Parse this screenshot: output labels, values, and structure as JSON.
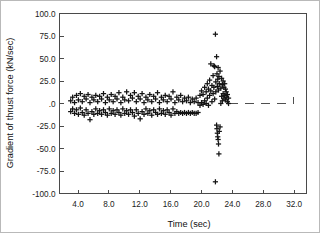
{
  "figure": {
    "background_color": "#ffffff",
    "border_color": "#b9b9b9",
    "marker_color": "#141414",
    "axis_color": "#4a4a4a"
  },
  "chart_data": {
    "type": "scatter",
    "title": "",
    "subtitle": "",
    "xlabel": "Time (sec)",
    "ylabel": "Gradient of thrust force (kN/sec)",
    "xlim": [
      1.6,
      33.6
    ],
    "ylim": [
      -100.0,
      100.0
    ],
    "grid": false,
    "legend": null,
    "legend_position": "none",
    "marker": "plus",
    "xticks": [
      4.0,
      8.0,
      12.0,
      16.0,
      20.0,
      24.0,
      28.0,
      32.0
    ],
    "xtick_labels": [
      "4.0",
      "8.0",
      "12.0",
      "16.0",
      "20.0",
      "24.0",
      "28.0",
      "32.0"
    ],
    "yticks": [
      100.0,
      75.0,
      50.0,
      25.0,
      0.0,
      -25.0,
      -50.0,
      -75.0,
      -100.0
    ],
    "ytick_labels": [
      "100.0",
      "75.0",
      "50.0",
      "25.0",
      ".0",
      "-25.0",
      "-50.0",
      "-75.0",
      "-100.0"
    ],
    "annotations": [
      {
        "name": "zero-reference-dashed-line",
        "type": "dashed-line",
        "y": 0.0,
        "x_start": 23.6,
        "x_end": 31.9,
        "end_tick_height": 7.0
      }
    ],
    "series": [
      {
        "name": "Gradient of thrust force",
        "marker": "plus",
        "color": "#141414",
        "points": [
          [
            3.05,
            3.0
          ],
          [
            3.05,
            -9.0
          ],
          [
            3.3,
            7.0
          ],
          [
            3.3,
            -6.0
          ],
          [
            3.55,
            1.0
          ],
          [
            3.55,
            -11.0
          ],
          [
            3.8,
            9.0
          ],
          [
            3.8,
            -7.0
          ],
          [
            4.05,
            4.0
          ],
          [
            4.05,
            -12.0
          ],
          [
            4.3,
            11.0
          ],
          [
            4.3,
            -5.0
          ],
          [
            4.55,
            2.0
          ],
          [
            4.55,
            -10.0
          ],
          [
            4.8,
            8.0
          ],
          [
            4.8,
            -13.0
          ],
          [
            5.05,
            5.0
          ],
          [
            5.05,
            -7.0
          ],
          [
            5.3,
            10.0
          ],
          [
            5.3,
            -11.0
          ],
          [
            5.55,
            1.0
          ],
          [
            5.55,
            -18.0
          ],
          [
            5.8,
            7.0
          ],
          [
            5.8,
            -9.0
          ],
          [
            6.05,
            4.0
          ],
          [
            6.05,
            -12.0
          ],
          [
            6.3,
            9.0
          ],
          [
            6.3,
            -6.0
          ],
          [
            6.55,
            2.0
          ],
          [
            6.55,
            -11.0
          ],
          [
            6.8,
            8.0
          ],
          [
            6.8,
            -8.0
          ],
          [
            7.05,
            5.0
          ],
          [
            7.05,
            -12.0
          ],
          [
            7.3,
            11.0
          ],
          [
            7.3,
            -7.0
          ],
          [
            7.55,
            1.0
          ],
          [
            7.55,
            -10.0
          ],
          [
            7.8,
            7.0
          ],
          [
            7.8,
            -13.0
          ],
          [
            8.05,
            4.0
          ],
          [
            8.05,
            -6.0
          ],
          [
            8.3,
            10.0
          ],
          [
            8.3,
            -11.0
          ],
          [
            8.55,
            2.0
          ],
          [
            8.55,
            -8.0
          ],
          [
            8.8,
            8.0
          ],
          [
            8.8,
            -12.0
          ],
          [
            9.05,
            5.0
          ],
          [
            9.05,
            -7.0
          ],
          [
            9.3,
            12.0
          ],
          [
            9.3,
            -10.0
          ],
          [
            9.55,
            1.0
          ],
          [
            9.55,
            -13.0
          ],
          [
            9.8,
            7.0
          ],
          [
            9.8,
            -6.0
          ],
          [
            10.05,
            4.0
          ],
          [
            10.05,
            -11.0
          ],
          [
            10.3,
            13.0
          ],
          [
            10.3,
            -8.0
          ],
          [
            10.55,
            3.0
          ],
          [
            10.55,
            -12.0
          ],
          [
            10.8,
            9.0
          ],
          [
            10.8,
            -7.0
          ],
          [
            11.05,
            6.0
          ],
          [
            11.05,
            -10.0
          ],
          [
            11.3,
            12.0
          ],
          [
            11.3,
            -14.0
          ],
          [
            11.55,
            2.0
          ],
          [
            11.55,
            -7.0
          ],
          [
            11.8,
            8.0
          ],
          [
            11.8,
            -11.0
          ],
          [
            12.05,
            5.0
          ],
          [
            12.05,
            -17.0
          ],
          [
            12.3,
            11.0
          ],
          [
            12.3,
            -9.0
          ],
          [
            12.55,
            1.0
          ],
          [
            12.55,
            -12.0
          ],
          [
            12.8,
            7.0
          ],
          [
            12.8,
            -6.0
          ],
          [
            13.05,
            4.0
          ],
          [
            13.05,
            -11.0
          ],
          [
            13.3,
            10.0
          ],
          [
            13.3,
            -8.0
          ],
          [
            13.55,
            2.0
          ],
          [
            13.55,
            -13.0
          ],
          [
            13.8,
            8.0
          ],
          [
            13.8,
            -7.0
          ],
          [
            14.05,
            5.0
          ],
          [
            14.05,
            -10.0
          ],
          [
            14.3,
            12.0
          ],
          [
            14.3,
            -12.0
          ],
          [
            14.55,
            1.0
          ],
          [
            14.55,
            -6.0
          ],
          [
            14.8,
            7.0
          ],
          [
            14.8,
            -11.0
          ],
          [
            15.05,
            4.0
          ],
          [
            15.05,
            -8.0
          ],
          [
            15.3,
            9.0
          ],
          [
            15.3,
            -12.0
          ],
          [
            15.55,
            2.0
          ],
          [
            15.55,
            -7.0
          ],
          [
            15.8,
            8.0
          ],
          [
            15.8,
            -10.0
          ],
          [
            16.05,
            5.0
          ],
          [
            16.05,
            -13.0
          ],
          [
            16.3,
            13.0
          ],
          [
            16.3,
            -6.0
          ],
          [
            16.55,
            1.0
          ],
          [
            16.55,
            -11.0
          ],
          [
            16.8,
            7.0
          ],
          [
            16.8,
            -9.0
          ],
          [
            17.05,
            4.0
          ],
          [
            17.05,
            -11.0
          ],
          [
            17.3,
            9.0
          ],
          [
            17.3,
            -10.0
          ],
          [
            17.55,
            2.0
          ],
          [
            17.55,
            -11.0
          ],
          [
            17.8,
            6.0
          ],
          [
            17.8,
            -10.0
          ],
          [
            18.05,
            3.0
          ],
          [
            18.05,
            -11.0
          ],
          [
            18.3,
            7.0
          ],
          [
            18.3,
            -10.0
          ],
          [
            18.55,
            1.0
          ],
          [
            18.55,
            -11.0
          ],
          [
            18.8,
            5.0
          ],
          [
            18.8,
            -10.0
          ],
          [
            19.05,
            2.0
          ],
          [
            19.05,
            -11.0
          ],
          [
            19.3,
            6.0
          ],
          [
            19.3,
            -11.0
          ],
          [
            19.55,
            1.0
          ],
          [
            19.55,
            -10.0
          ],
          [
            19.8,
            9.0
          ],
          [
            19.8,
            -2.0
          ],
          [
            20.0,
            14.0
          ],
          [
            20.0,
            1.0
          ],
          [
            20.2,
            10.0
          ],
          [
            20.2,
            -1.0
          ],
          [
            20.4,
            18.0
          ],
          [
            20.4,
            3.0
          ],
          [
            20.6,
            13.0
          ],
          [
            20.6,
            0.0
          ],
          [
            20.75,
            22.0
          ],
          [
            20.75,
            6.0
          ],
          [
            20.9,
            16.0
          ],
          [
            20.9,
            -2.0
          ],
          [
            21.05,
            26.0
          ],
          [
            21.05,
            9.0
          ],
          [
            21.2,
            44.0
          ],
          [
            21.2,
            14.0
          ],
          [
            21.35,
            20.0
          ],
          [
            21.35,
            2.0
          ],
          [
            21.5,
            31.0
          ],
          [
            21.5,
            11.0
          ],
          [
            21.6,
            42.0
          ],
          [
            21.6,
            18.0
          ],
          [
            21.7,
            41.0
          ],
          [
            21.7,
            5.0
          ],
          [
            21.8,
            77.0
          ],
          [
            21.8,
            -87.0
          ],
          [
            21.85,
            24.0
          ],
          [
            21.85,
            13.0
          ],
          [
            21.95,
            52.0
          ],
          [
            21.95,
            -24.0
          ],
          [
            22.0,
            33.0
          ],
          [
            22.0,
            -28.0
          ],
          [
            22.05,
            19.0
          ],
          [
            22.05,
            -33.0
          ],
          [
            22.1,
            27.0
          ],
          [
            22.1,
            -37.0
          ],
          [
            22.15,
            40.0
          ],
          [
            22.15,
            -40.0
          ],
          [
            22.2,
            15.0
          ],
          [
            22.2,
            -45.0
          ],
          [
            22.25,
            30.0
          ],
          [
            22.25,
            -56.0
          ],
          [
            22.3,
            22.0
          ],
          [
            22.3,
            -31.0
          ],
          [
            22.4,
            36.0
          ],
          [
            22.4,
            -26.0
          ],
          [
            22.5,
            17.0
          ],
          [
            22.5,
            0.0
          ],
          [
            22.6,
            28.0
          ],
          [
            22.6,
            8.0
          ],
          [
            22.7,
            21.0
          ],
          [
            22.7,
            3.0
          ],
          [
            22.8,
            25.0
          ],
          [
            22.8,
            11.0
          ],
          [
            22.9,
            18.0
          ],
          [
            22.9,
            6.0
          ],
          [
            23.0,
            22.0
          ],
          [
            23.0,
            9.0
          ],
          [
            23.1,
            16.0
          ],
          [
            23.1,
            4.0
          ],
          [
            23.2,
            13.0
          ],
          [
            23.2,
            7.0
          ],
          [
            23.35,
            10.0
          ],
          [
            23.35,
            2.0
          ],
          [
            23.5,
            6.0
          ],
          [
            23.5,
            0.0
          ]
        ]
      }
    ]
  }
}
